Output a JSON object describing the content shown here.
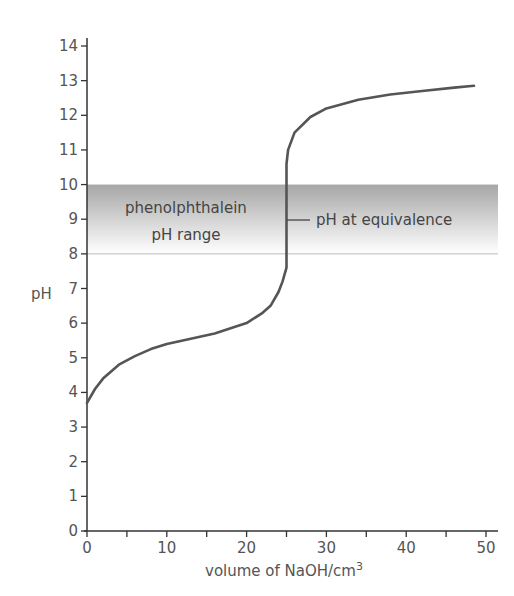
{
  "chart_data": {
    "type": "line",
    "title": "",
    "xlabel": "volume of NaOH/cm",
    "xlabel_superscript": "3",
    "ylabel": "pH",
    "xlim": [
      0,
      50
    ],
    "ylim": [
      0,
      14
    ],
    "x_ticks": [
      0,
      10,
      20,
      30,
      40,
      50
    ],
    "x_minor_ticks": [
      5,
      15,
      25,
      35,
      45
    ],
    "y_ticks": [
      0,
      1,
      2,
      3,
      4,
      5,
      6,
      7,
      8,
      9,
      10,
      11,
      12,
      13,
      14
    ],
    "grid": false,
    "series": [
      {
        "name": "titration curve",
        "x": [
          0,
          1,
          2,
          4,
          6,
          8,
          10,
          12,
          14,
          16,
          18,
          20,
          22,
          23,
          24,
          24.5,
          25,
          25,
          25.2,
          26,
          28,
          30,
          34,
          38,
          42,
          46,
          48.5
        ],
        "y": [
          3.7,
          4.1,
          4.4,
          4.8,
          5.05,
          5.25,
          5.4,
          5.5,
          5.6,
          5.7,
          5.85,
          6.0,
          6.3,
          6.5,
          6.9,
          7.2,
          7.6,
          10.6,
          11.0,
          11.5,
          11.95,
          12.2,
          12.45,
          12.6,
          12.7,
          12.8,
          12.85
        ]
      }
    ],
    "bands": [
      {
        "label": "phenolphthalein pH range",
        "y_from": 8,
        "y_to": 10
      }
    ],
    "annotations": [
      {
        "text": "pH at equivalence",
        "x": 25,
        "y": 9
      }
    ],
    "colors": {
      "curve": "#555555",
      "band_top": "#a8a8a8",
      "band_bottom": "#ffffff",
      "axis": "#333333"
    }
  },
  "labels": {
    "band_line1": "phenolphthalein",
    "band_line2": "pH range",
    "equivalence": "pH at equivalence",
    "ylabel": "pH",
    "xlabel": "volume of NaOH/cm",
    "xlabel_sup": "3"
  }
}
